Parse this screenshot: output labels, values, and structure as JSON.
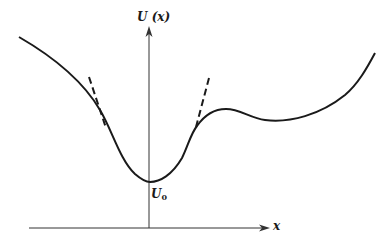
{
  "figure": {
    "type": "potential-energy-curve",
    "y_axis_label": "U (x)",
    "x_axis_label": "x",
    "minimum_label": {
      "main": "U",
      "subscript": "0"
    },
    "colors": {
      "curve": "#1a1a1a",
      "axes": "#333333",
      "tangent": "#1a1a1a",
      "background": "#ffffff"
    },
    "features": [
      "potential well with minimum U0 at x=0",
      "dashed parabolic-approximation tangents on both sides of well",
      "local maximum to the right of the well",
      "shallow local minimum then rising curve on the right"
    ]
  }
}
